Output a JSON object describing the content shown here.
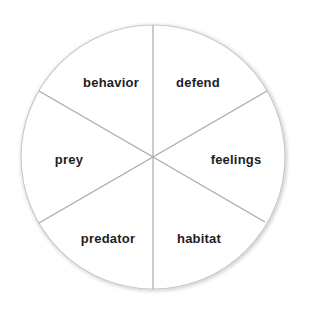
{
  "diagram": {
    "type": "wheel",
    "segments": [
      {
        "label": "behavior",
        "x": 107,
        "y": 82
      },
      {
        "label": "defend",
        "x": 198,
        "y": 82
      },
      {
        "label": "feelings",
        "x": 236,
        "y": 159
      },
      {
        "label": "habitat",
        "x": 199,
        "y": 237
      },
      {
        "label": "predator",
        "x": 108,
        "y": 237
      },
      {
        "label": "prey",
        "x": 69,
        "y": 159
      }
    ],
    "colors": {
      "fill": "#ffffff",
      "stroke": "#a8a8a8",
      "text": "#1e1e1e"
    }
  }
}
